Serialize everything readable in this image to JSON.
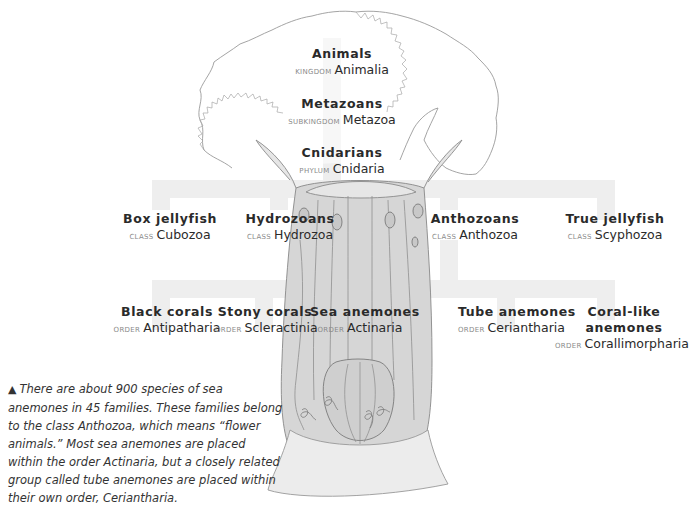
{
  "diagram": {
    "colors": {
      "connector": "#eeeeee",
      "text": "#2a2a2a",
      "rank": "#8a8a8a",
      "illustration": "#7a7a7a"
    },
    "levels": {
      "kingdom": {
        "common": "Animals",
        "rank": "Kingdom",
        "scientific": "Animalia"
      },
      "subkingdom": {
        "common": "Metazoans",
        "rank": "Subkingdom",
        "scientific": "Metazoa"
      },
      "phylum": {
        "common": "Cnidarians",
        "rank": "Phylum",
        "scientific": "Cnidaria"
      }
    },
    "classes": [
      {
        "common": "Box jellyfish",
        "rank": "Class",
        "scientific": "Cubozoa"
      },
      {
        "common": "Hydrozoans",
        "rank": "Class",
        "scientific": "Hydrozoa"
      },
      {
        "common": "Anthozoans",
        "rank": "Class",
        "scientific": "Anthozoa"
      },
      {
        "common": "True jellyfish",
        "rank": "Class",
        "scientific": "Scyphozoa"
      }
    ],
    "orders": [
      {
        "common": "Black corals",
        "rank": "Order",
        "scientific": "Antipatharia"
      },
      {
        "common": "Stony corals",
        "rank": "Order",
        "scientific": "Scleractinia"
      },
      {
        "common": "Sea anemones",
        "rank": "Order",
        "scientific": "Actinaria"
      },
      {
        "common": "Tube anemones",
        "rank": "Order",
        "scientific": "Ceriantharia"
      },
      {
        "common_line1": "Coral-like",
        "common_line2": "anemones",
        "rank": "Order",
        "scientific": "Corallimorpharia"
      }
    ],
    "caption": {
      "marker": "▲",
      "text": "There are about 900 species of sea anemones in 45 families. These families belong to the class Anthozoa, which means “flower animals.” Most sea anemones are placed within the order Actinaria, but a closely related group called tube anemones are placed within their own order, Ceriantharia."
    }
  }
}
